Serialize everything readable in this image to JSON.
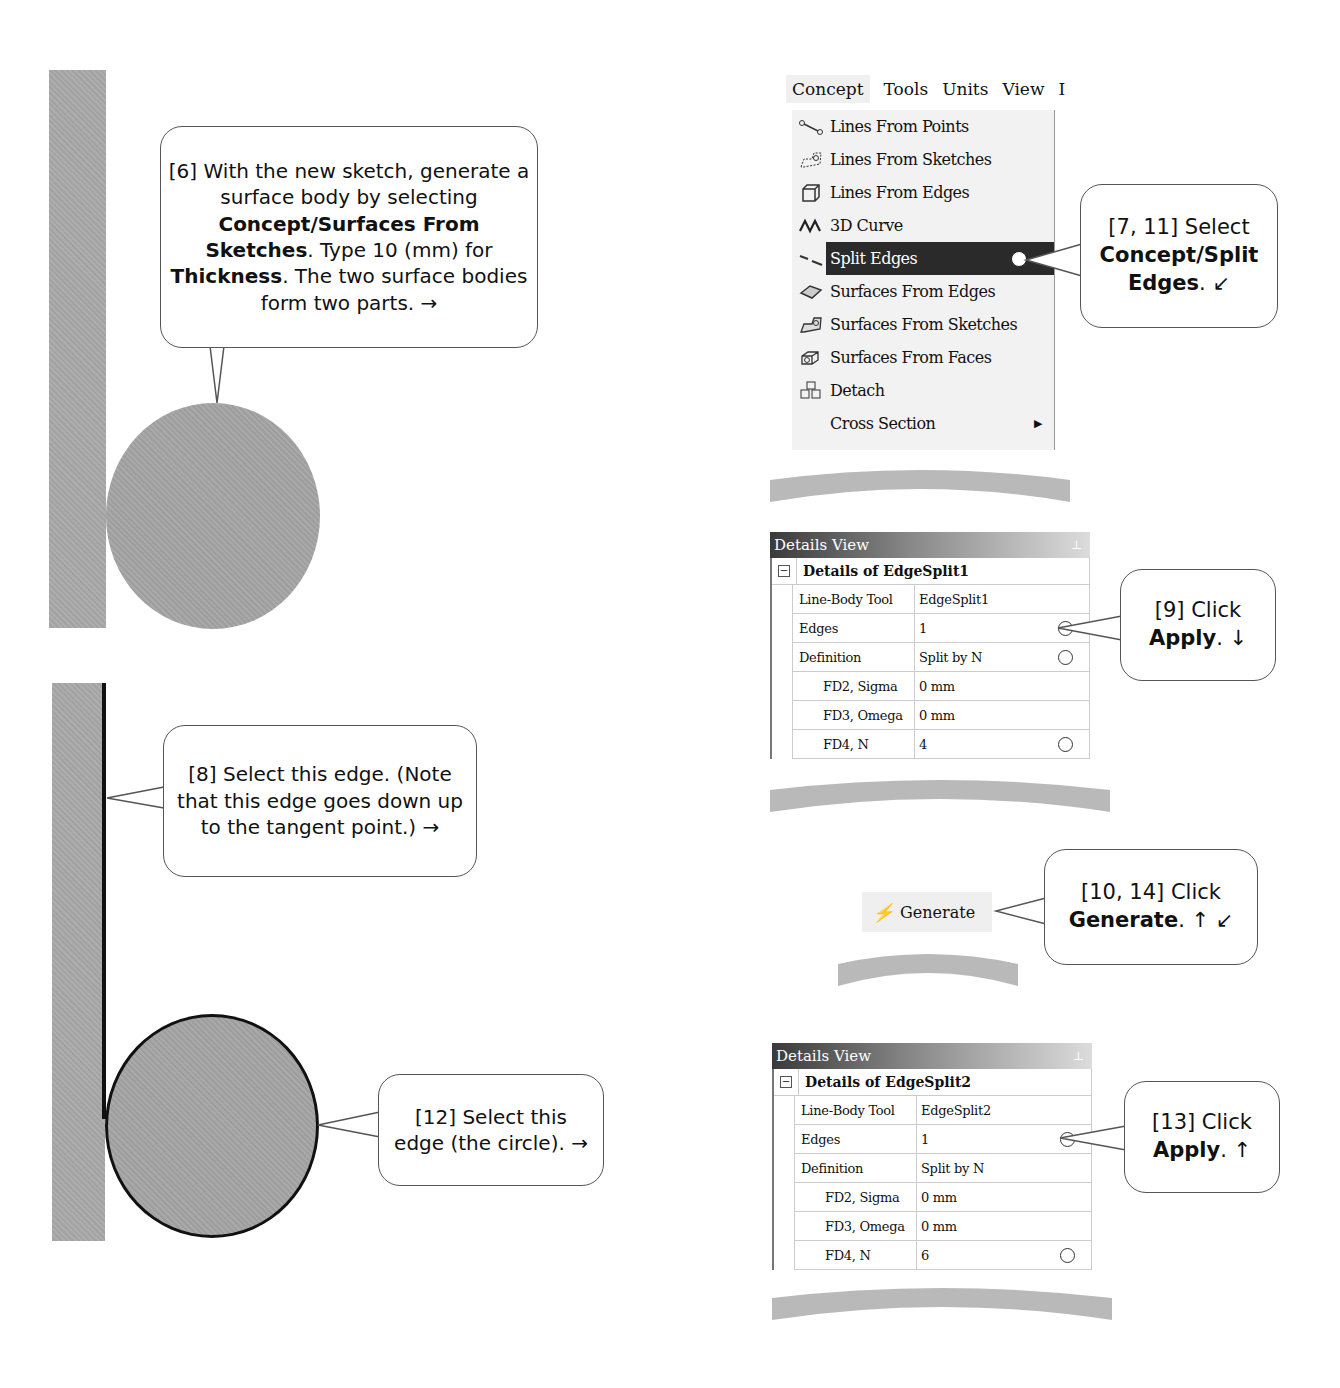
{
  "callouts": {
    "step6": {
      "prefix": "[6] With the new sketch, generate a surface body by selecting ",
      "bold1": "Concept/Surfaces From Sketches",
      "mid": ". Type 10 (mm) for ",
      "bold2": "Thickness",
      "suffix": ". The two surface bodies form two parts. →"
    },
    "step7_11": {
      "prefix": "[7, 11] Select ",
      "bold": "Concept/Split Edges",
      "suffix": ". ↙"
    },
    "step8": {
      "text": "[8] Select this edge. (Note that this edge goes down up to the tangent point.) →"
    },
    "step9": {
      "prefix": "[9] Click ",
      "bold": "Apply",
      "suffix": ". ↓"
    },
    "step10_14": {
      "prefix": "[10, 14] Click ",
      "bold": "Generate",
      "suffix": ". ↑ ↙"
    },
    "step12": {
      "text": "[12] Select this edge (the circle). →"
    },
    "step13": {
      "prefix": "[13] Click ",
      "bold": "Apply",
      "suffix": ". ↑"
    }
  },
  "menubar": {
    "items": [
      "Concept",
      "Tools",
      "Units",
      "View"
    ]
  },
  "concept_menu": {
    "items": [
      {
        "label": "Lines From Points",
        "icon": "lines-from-points-icon"
      },
      {
        "label": "Lines From Sketches",
        "icon": "lines-from-sketches-icon"
      },
      {
        "label": "Lines From Edges",
        "icon": "lines-from-edges-icon"
      },
      {
        "label": "3D Curve",
        "icon": "3d-curve-icon"
      },
      {
        "label": "Split Edges",
        "icon": "split-edges-icon",
        "selected": true
      },
      {
        "label": "Surfaces From Edges",
        "icon": "surfaces-from-edges-icon"
      },
      {
        "label": "Surfaces From Sketches",
        "icon": "surfaces-from-sketches-icon"
      },
      {
        "label": "Surfaces From Faces",
        "icon": "surfaces-from-faces-icon"
      },
      {
        "label": "Detach",
        "icon": "detach-icon"
      },
      {
        "label": "Cross Section",
        "icon": "",
        "submenu": true
      }
    ]
  },
  "details_view_1": {
    "header": "Details View",
    "title": "Details of EdgeSplit1",
    "rows": [
      {
        "key": "Line-Body Tool",
        "value": "EdgeSplit1"
      },
      {
        "key": "Edges",
        "value": "1"
      },
      {
        "key": "Definition",
        "value": "Split by N"
      },
      {
        "key": "FD2, Sigma",
        "value": "0 mm"
      },
      {
        "key": "FD3, Omega",
        "value": "0 mm"
      },
      {
        "key": "FD4, N",
        "value": "4"
      }
    ]
  },
  "details_view_2": {
    "header": "Details View",
    "title": "Details of EdgeSplit2",
    "rows": [
      {
        "key": "Line-Body Tool",
        "value": "EdgeSplit2"
      },
      {
        "key": "Edges",
        "value": "1"
      },
      {
        "key": "Definition",
        "value": "Split by N"
      },
      {
        "key": "FD2, Sigma",
        "value": "0 mm"
      },
      {
        "key": "FD3, Omega",
        "value": "0 mm"
      },
      {
        "key": "FD4, N",
        "value": "6"
      }
    ]
  },
  "toolbar": {
    "generate_label": "Generate"
  },
  "colors": {
    "body_gray": "#a9a9a9",
    "selection_dark": "#2a2a2a",
    "edge_highlight": "#111111"
  }
}
